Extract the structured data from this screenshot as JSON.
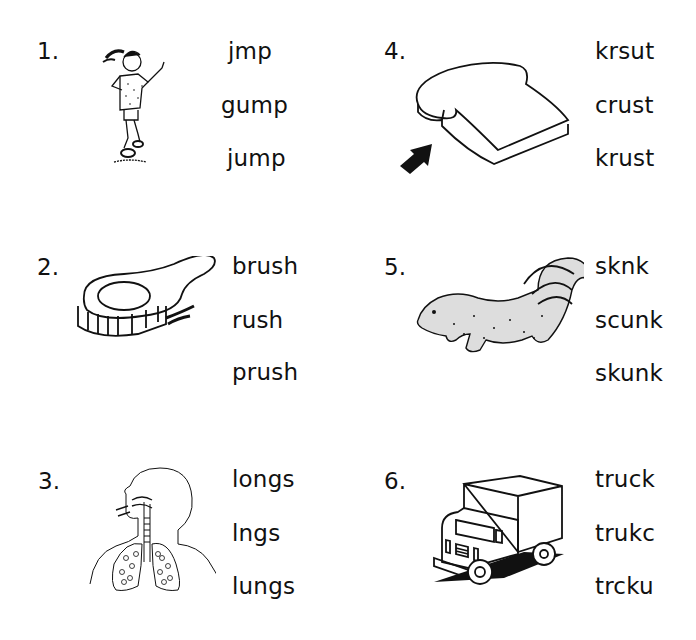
{
  "worksheet": {
    "items": [
      {
        "number": "1.",
        "picture": "girl-jumping",
        "choices": [
          "jmp",
          "gump",
          "jump"
        ]
      },
      {
        "number": "2.",
        "picture": "hair-brush",
        "choices": [
          "brush",
          "rush",
          "prush"
        ]
      },
      {
        "number": "3.",
        "picture": "lungs-diagram",
        "choices": [
          "longs",
          "lngs",
          "lungs"
        ]
      },
      {
        "number": "4.",
        "picture": "bread-slice-with-arrow",
        "choices": [
          "krsut",
          "crust",
          "krust"
        ]
      },
      {
        "number": "5.",
        "picture": "skunk",
        "choices": [
          "sknk",
          "scunk",
          "skunk"
        ]
      },
      {
        "number": "6.",
        "picture": "truck",
        "choices": [
          "truck",
          "trukc",
          "trcku"
        ]
      }
    ]
  }
}
